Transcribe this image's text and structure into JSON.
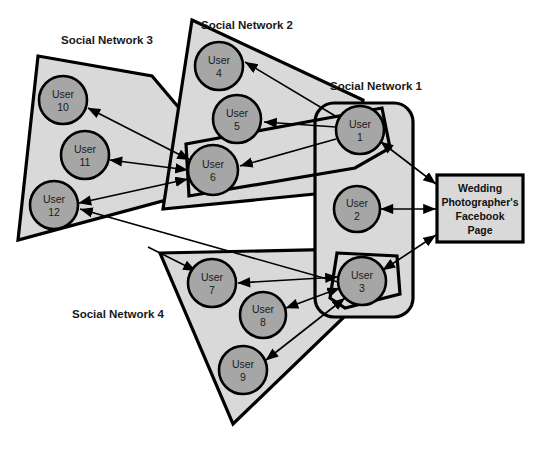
{
  "diagram": {
    "colors": {
      "network_fill": "#d9d9d9",
      "network_stroke": "#000000",
      "node_fill": "#a6a6a6",
      "node_stroke": "#000000",
      "box_fill": "#d9d9d9",
      "box_stroke": "#000000",
      "arrow": "#000000",
      "text": "#1a1a1a",
      "background": "#ffffff"
    },
    "networks": [
      {
        "id": "sn1",
        "label": "Social Network 1",
        "label_x": 376,
        "label_y": 90,
        "shape": "rounded-rectangle",
        "points": "315,103 413,103 413,317 315,317",
        "rx": 18
      },
      {
        "id": "sn2",
        "label": "Social Network 2",
        "label_x": 247,
        "label_y": 29,
        "shape": "quadrilateral",
        "points": "192,20 363,100 355,190 163,209"
      },
      {
        "id": "sn3",
        "label": "Social Network 3",
        "label_x": 80,
        "label_y": 44,
        "shape": "quadrilateral",
        "points": "38,56 152,76 240,180 18,240"
      },
      {
        "id": "sn4",
        "label": "Social Network 4",
        "label_x": 72,
        "label_y": 318,
        "shape": "quadrilateral",
        "points": "160,253 400,248 400,262 233,424"
      }
    ],
    "nodes": [
      {
        "id": "u1",
        "label_line1": "User",
        "label_line2": "1",
        "cx": 360,
        "cy": 130,
        "r": 24,
        "network": "sn1"
      },
      {
        "id": "u2",
        "label_line1": "User",
        "label_line2": "2",
        "cx": 357,
        "cy": 209,
        "r": 23,
        "network": "sn1"
      },
      {
        "id": "u3",
        "label_line1": "User",
        "label_line2": "3",
        "cx": 362,
        "cy": 281,
        "r": 24,
        "network": "sn1"
      },
      {
        "id": "u4",
        "label_line1": "User",
        "label_line2": "4",
        "cx": 219,
        "cy": 66,
        "r": 24,
        "network": "sn2"
      },
      {
        "id": "u5",
        "label_line1": "User",
        "label_line2": "5",
        "cx": 237,
        "cy": 119,
        "r": 24,
        "network": "sn2"
      },
      {
        "id": "u6",
        "label_line1": "User",
        "label_line2": "6",
        "cx": 213,
        "cy": 170,
        "r": 25,
        "network": "sn2"
      },
      {
        "id": "u7",
        "label_line1": "User",
        "label_line2": "7",
        "cx": 212,
        "cy": 283,
        "r": 24,
        "network": "sn4"
      },
      {
        "id": "u8",
        "label_line1": "User",
        "label_line2": "8",
        "cx": 263,
        "cy": 315,
        "r": 23,
        "network": "sn4"
      },
      {
        "id": "u9",
        "label_line1": "User",
        "label_line2": "9",
        "cx": 243,
        "cy": 370,
        "r": 24,
        "network": "sn4"
      },
      {
        "id": "u10",
        "label_line1": "User",
        "label_line2": "10",
        "cx": 63,
        "cy": 100,
        "r": 24,
        "network": "sn3"
      },
      {
        "id": "u11",
        "label_line1": "User",
        "label_line2": "11",
        "cx": 85,
        "cy": 155,
        "r": 24,
        "network": "sn3"
      },
      {
        "id": "u12",
        "label_line1": "User",
        "label_line2": "12",
        "cx": 54,
        "cy": 205,
        "r": 24,
        "network": "sn3"
      }
    ],
    "fanbox": {
      "id": "wedding-page",
      "lines": [
        "Wedding",
        "Photographer's",
        "Facebook",
        "Page"
      ],
      "x": 437,
      "y": 175,
      "width": 86,
      "height": 67
    },
    "edges": [
      {
        "id": "u1-u4",
        "from": "u1",
        "to": "u4",
        "direction": "one-way"
      },
      {
        "id": "u1-u5",
        "from": "u1",
        "to": "u5",
        "direction": "one-way"
      },
      {
        "id": "u1-u6",
        "from": "u1",
        "to": "u6",
        "direction": "one-way"
      },
      {
        "id": "u6-u10",
        "from": "u6",
        "to": "u10",
        "direction": "two-way"
      },
      {
        "id": "u6-u11",
        "from": "u6",
        "to": "u11",
        "direction": "two-way"
      },
      {
        "id": "u6-u12",
        "from": "u6",
        "to": "u12",
        "direction": "two-way"
      },
      {
        "id": "u1-u12",
        "from": "u1",
        "to": "u12",
        "direction": "one-way"
      },
      {
        "id": "u1-page",
        "from": "u1",
        "to": "wedding-page",
        "direction": "two-way"
      },
      {
        "id": "u2-page",
        "from": "u2",
        "to": "wedding-page",
        "direction": "two-way"
      },
      {
        "id": "u3-page",
        "from": "u3",
        "to": "wedding-page",
        "direction": "two-way"
      },
      {
        "id": "u3-u7",
        "from": "u3",
        "to": "u7",
        "direction": "two-way"
      },
      {
        "id": "u3-u8",
        "from": "u3",
        "to": "u8",
        "direction": "two-way"
      },
      {
        "id": "u3-u9",
        "from": "u3",
        "to": "u9",
        "direction": "two-way"
      },
      {
        "id": "u7-sn4",
        "from": "u3",
        "to": "u7",
        "direction": "one-way"
      }
    ]
  }
}
